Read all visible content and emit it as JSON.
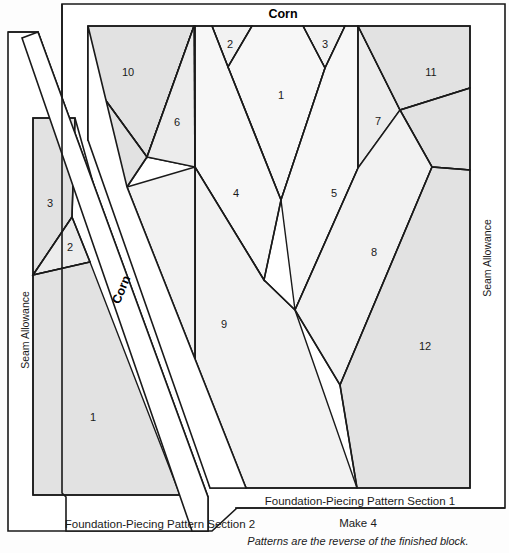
{
  "page": {
    "width": 509,
    "height": 553,
    "background_color": "#fdfdfd",
    "line_color": "#1a1a1a",
    "fill_light": "#f7f7f7",
    "fill_mid": "#ececec",
    "fill_dark": "#e2e2e2"
  },
  "labels": {
    "title_top": "Corn",
    "title_diagonal": "Corn",
    "seam_allowance_left": "Seam Allowance",
    "seam_allowance_right": "Seam Allowance",
    "section1_caption": "Foundation-Piecing Pattern Section 1",
    "section2_caption": "Foundation-Piecing Pattern Section 2",
    "make_note": "Make 4",
    "reverse_note": "Patterns are the reverse of the finished block."
  },
  "section1": {
    "name": "Foundation-Piecing Pattern Section 1",
    "piece_numbers": [
      "1",
      "2",
      "3",
      "4",
      "5",
      "6",
      "7",
      "8",
      "9",
      "10",
      "11",
      "12"
    ],
    "pieces": [
      {
        "n": "1",
        "x": 281,
        "y": 96,
        "shade": "d"
      },
      {
        "n": "2",
        "x": 230,
        "y": 45,
        "shade": "c"
      },
      {
        "n": "3",
        "x": 325,
        "y": 45,
        "shade": "c"
      },
      {
        "n": "4",
        "x": 236,
        "y": 194,
        "shade": "d"
      },
      {
        "n": "5",
        "x": 334,
        "y": 194,
        "shade": "d"
      },
      {
        "n": "6",
        "x": 177,
        "y": 123,
        "shade": "b"
      },
      {
        "n": "7",
        "x": 378,
        "y": 122,
        "shade": "b"
      },
      {
        "n": "8",
        "x": 374,
        "y": 253,
        "shade": "c"
      },
      {
        "n": "9",
        "x": 224,
        "y": 325,
        "shade": "c"
      },
      {
        "n": "10",
        "x": 128,
        "y": 73,
        "shade": "a"
      },
      {
        "n": "11",
        "x": 431,
        "y": 73,
        "shade": "a"
      },
      {
        "n": "12",
        "x": 425,
        "y": 347,
        "shade": "a"
      }
    ]
  },
  "section2": {
    "name": "Foundation-Piecing Pattern Section 2",
    "piece_numbers": [
      "1",
      "2",
      "3"
    ],
    "pieces": [
      {
        "n": "1",
        "x": 93,
        "y": 418,
        "shade": "a"
      },
      {
        "n": "2",
        "x": 70,
        "y": 248,
        "shade": "b"
      },
      {
        "n": "3",
        "x": 50,
        "y": 204,
        "shade": "a"
      }
    ]
  }
}
